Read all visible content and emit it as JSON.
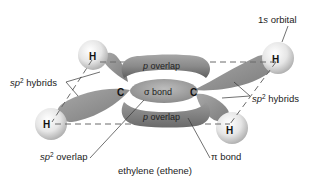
{
  "diagram": {
    "caption": "ethylene (ethene)",
    "labels": {
      "one_s_orbital": {
        "prefix": "1",
        "italic": "s",
        "suffix": " orbital"
      },
      "sp2_hybrids_left": {
        "italic": "sp",
        "sup": "2",
        "suffix": " hybrids"
      },
      "sp2_hybrids_right": {
        "italic": "sp",
        "sup": "2",
        "suffix": " hybrids"
      },
      "sp2_overlap": {
        "italic": "sp",
        "sup": "2",
        "suffix": " overlap"
      },
      "pi_bond": {
        "symbol": "π",
        "suffix": " bond"
      },
      "p_overlap_top": {
        "italic": "p",
        "suffix": " overlap"
      },
      "p_overlap_bottom": {
        "italic": "p",
        "suffix": " overlap"
      },
      "sigma_bond": {
        "symbol": "σ",
        "suffix": " bond"
      }
    },
    "atoms": {
      "carbon_left": "C",
      "carbon_right": "C",
      "hydrogen_top_left": "H",
      "hydrogen_bottom_left": "H",
      "hydrogen_top_right": "H",
      "hydrogen_bottom_right": "H"
    },
    "colors": {
      "lobe_dark": "#7a7a7a",
      "lobe_light": "#c8c8c8",
      "sphere_light": "#f4f4f4",
      "sphere_dark": "#b8b8b8",
      "dash_line": "#666666",
      "leader_line": "#333333"
    }
  }
}
